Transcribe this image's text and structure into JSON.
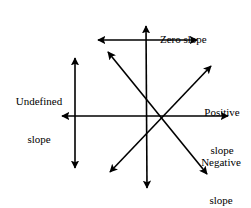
{
  "figure": {
    "background_color": "#ffffff",
    "stroke_color": "#000000",
    "labels": {
      "zero": {
        "line1": "Zero slope"
      },
      "undefined": {
        "line1": "Undefined",
        "line2": "slope"
      },
      "positive": {
        "line1": "Positive",
        "line2": "slope"
      },
      "negative": {
        "line1": "Negative",
        "line2": "slope"
      }
    }
  },
  "chart_data": {
    "type": "diagram",
    "xlabel": "",
    "ylabel": "",
    "center": {
      "x": 162,
      "y": 116
    },
    "annotations": [
      "Zero slope",
      "Undefined slope",
      "Positive slope",
      "Negative slope"
    ],
    "series": [
      {
        "name": "Zero slope",
        "slope": 0,
        "arrow": "double",
        "x1": 98,
        "y1": 40,
        "x2": 197,
        "y2": 40
      },
      {
        "name": "Zero slope (main horizontal axis)",
        "slope": 0,
        "arrow": "double",
        "x1": 62,
        "y1": 116,
        "x2": 228,
        "y2": 116
      },
      {
        "name": "Undefined slope",
        "slope": null,
        "arrow": "double",
        "x1": 75,
        "y1": 58,
        "x2": 75,
        "y2": 168
      },
      {
        "name": "Undefined slope (main vertical axis)",
        "slope": null,
        "arrow": "double",
        "x1": 146,
        "y1": 26,
        "x2": 147,
        "y2": 188
      },
      {
        "name": "Positive slope",
        "slope": 1.7,
        "arrow": "double",
        "x1": 110,
        "y1": 172,
        "x2": 211,
        "y2": 66
      },
      {
        "name": "Negative slope",
        "slope": -1.2,
        "arrow": "double",
        "x1": 108,
        "y1": 52,
        "x2": 207,
        "y2": 174
      }
    ]
  }
}
